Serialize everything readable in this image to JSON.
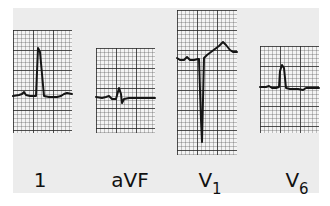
{
  "figure": {
    "colors": {
      "background": "#ececec",
      "grid_paper": "#f3f3f3",
      "trace": "#151515"
    },
    "leads": [
      {
        "id": "I",
        "label": "1",
        "subscript": ""
      },
      {
        "id": "aVF",
        "label": "aVF",
        "subscript": ""
      },
      {
        "id": "V1",
        "label": "V",
        "subscript": "1"
      },
      {
        "id": "V6",
        "label": "V",
        "subscript": "6"
      }
    ]
  }
}
